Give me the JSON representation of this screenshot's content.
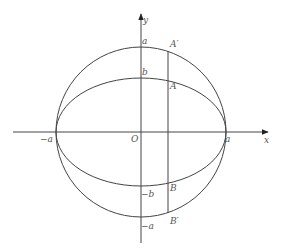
{
  "diagram": {
    "colors": {
      "stroke": "#444444",
      "text": "#555555",
      "background": "#ffffff"
    },
    "geometry": {
      "origin_px": [
        141,
        132
      ],
      "circle_radius_px": 85,
      "ellipse_semi_major_px": 85,
      "ellipse_semi_minor_px": 54,
      "vertical_line_x_px": 168
    },
    "labels": {
      "y_axis": "y",
      "x_axis": "x",
      "origin": "O",
      "a_top": "a",
      "b_top": "b",
      "neg_b": "−b",
      "neg_a_bottom": "−a",
      "neg_a_left": "−a",
      "a_right": "a",
      "A_prime": "A′",
      "A": "A",
      "B": "B",
      "B_prime": "B′"
    }
  }
}
